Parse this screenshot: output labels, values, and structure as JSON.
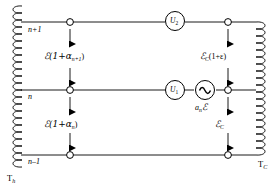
{
  "figure": {
    "type": "circuit-diagram"
  },
  "rails": [
    {
      "id": "top",
      "node_label": "n+1"
    },
    {
      "id": "middle",
      "node_label": "n"
    },
    {
      "id": "bottom",
      "node_label": "n–1"
    }
  ],
  "reservoirs": {
    "left": {
      "label": "T",
      "subscript": "h"
    },
    "right": {
      "label": "T",
      "subscript": "C"
    }
  },
  "meters": [
    {
      "id": "u2",
      "label": "U",
      "subscript": "2",
      "rail": "top"
    },
    {
      "id": "u1",
      "label": "U",
      "subscript": "1",
      "rail": "middle"
    }
  ],
  "source": {
    "id": "ac-source",
    "symbol": "∿",
    "label_prefix": "a",
    "label_subscript": "n",
    "label_emf": "ℰ"
  },
  "emf_arrows": [
    {
      "id": "left-upper",
      "text": "ℰ(1+α",
      "subscript": "n+1",
      "text_end": ")",
      "side": "left",
      "between": [
        "top",
        "middle"
      ]
    },
    {
      "id": "left-lower",
      "text": "ℰ(1+α",
      "subscript": "n",
      "text_end": ")",
      "side": "left",
      "between": [
        "middle",
        "bottom"
      ]
    },
    {
      "id": "right-upper",
      "text": "ℰ",
      "subscript": "C",
      "text_end": "(1+ε)",
      "side": "right",
      "between": [
        "top",
        "middle"
      ]
    },
    {
      "id": "right-lower",
      "text": "ℰ",
      "subscript": "C",
      "text_end": "",
      "side": "right",
      "between": [
        "middle",
        "bottom"
      ]
    }
  ],
  "colors": {
    "line": "#000000",
    "background": "#ffffff",
    "node_fill": "#ffffff"
  }
}
